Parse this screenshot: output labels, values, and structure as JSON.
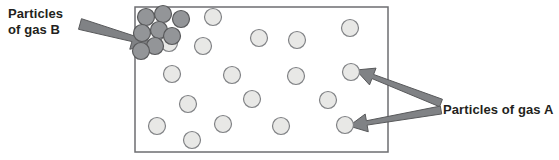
{
  "diagram": {
    "labels": {
      "gas_b": {
        "line1": "Particles",
        "line2": "of gas B"
      },
      "gas_a": "Particles of gas A"
    },
    "colors": {
      "text": "#231f20",
      "box_border": "#6d6e71",
      "box_fill": "#ffffff",
      "arrow_fill": "#808285",
      "arrow_stroke": "#58595b",
      "gas_a_fill": "#e8e8e6",
      "gas_a_stroke": "#808285",
      "gas_b_fill": "#939598",
      "gas_b_stroke": "#58595b"
    },
    "container": {
      "x": 135,
      "y": 7,
      "width": 253,
      "height": 145,
      "border_width": 1.5
    },
    "particle_radius": 8.5,
    "gas_b_particles": [
      {
        "cx": 146,
        "cy": 17
      },
      {
        "cx": 163,
        "cy": 14
      },
      {
        "cx": 181,
        "cy": 19
      },
      {
        "cx": 142,
        "cy": 33
      },
      {
        "cx": 159,
        "cy": 30
      },
      {
        "cx": 155,
        "cy": 46
      },
      {
        "cx": 172,
        "cy": 36
      },
      {
        "cx": 141,
        "cy": 51
      }
    ],
    "gas_a_particles": [
      {
        "cx": 213,
        "cy": 17
      },
      {
        "cx": 259,
        "cy": 38
      },
      {
        "cx": 297,
        "cy": 40
      },
      {
        "cx": 350,
        "cy": 28
      },
      {
        "cx": 169,
        "cy": 43
      },
      {
        "cx": 203,
        "cy": 46
      },
      {
        "cx": 172,
        "cy": 74
      },
      {
        "cx": 232,
        "cy": 75
      },
      {
        "cx": 296,
        "cy": 76
      },
      {
        "cx": 351,
        "cy": 72
      },
      {
        "cx": 188,
        "cy": 104
      },
      {
        "cx": 252,
        "cy": 99
      },
      {
        "cx": 328,
        "cy": 100
      },
      {
        "cx": 157,
        "cy": 126
      },
      {
        "cx": 223,
        "cy": 124
      },
      {
        "cx": 281,
        "cy": 126
      },
      {
        "cx": 345,
        "cy": 125
      },
      {
        "cx": 192,
        "cy": 140
      }
    ],
    "arrows": {
      "gas_b_arrow": {
        "name": "arrow-to-gas-b",
        "tail_x": 80,
        "tail_y": 24,
        "tip_x": 152,
        "tip_y": 44
      },
      "gas_a_arrow_upper": {
        "name": "arrow-to-gas-a-upper",
        "tail_x": 441,
        "tail_y": 103,
        "tip_x": 356,
        "tip_y": 70
      },
      "gas_a_arrow_lower": {
        "name": "arrow-to-gas-a-lower",
        "tail_x": 441,
        "tail_y": 110,
        "tip_x": 349,
        "tip_y": 126
      }
    }
  }
}
